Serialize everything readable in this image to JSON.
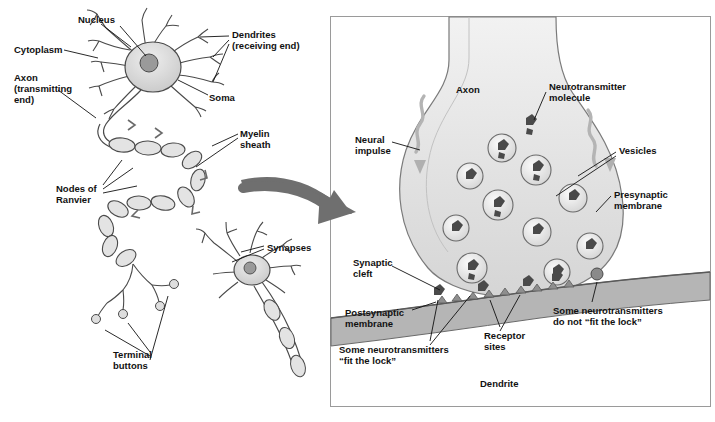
{
  "figure": {
    "panels": [
      {
        "id": "left",
        "name": "neuron-overview"
      },
      {
        "id": "right",
        "name": "synapse-detail"
      }
    ]
  },
  "colors": {
    "outline": "#4a4a4a",
    "cell_fill": "#d8d8d8",
    "cell_fill_light": "#ececec",
    "nucleus_fill": "#9a9a9a",
    "axon_fill": "#e3e3e3",
    "membrane_band": "#b8b8b8",
    "vesicle_fill": "#e8e8e8",
    "neurotransmitter": "#4a4a4a",
    "arrow_fill": "#5a5a5a",
    "panel_border": "#9a9a9a",
    "label_text": "#111111"
  },
  "left_panel": {
    "labels": [
      {
        "id": "nucleus",
        "text": "Nucleus",
        "x": 78,
        "y": 14,
        "align": "left"
      },
      {
        "id": "dendrites",
        "text": "Dendrites\n(receiving end)",
        "x": 232,
        "y": 29,
        "align": "left"
      },
      {
        "id": "cytoplasm",
        "text": "Cytoplasm",
        "x": 14,
        "y": 44,
        "align": "left"
      },
      {
        "id": "soma",
        "text": "Soma",
        "x": 209,
        "y": 92,
        "align": "left"
      },
      {
        "id": "axon",
        "text": "Axon\n(transmitting\nend)",
        "x": 14,
        "y": 72,
        "align": "left"
      },
      {
        "id": "myelin",
        "text": "Myelin\nsheath",
        "x": 240,
        "y": 128,
        "align": "left"
      },
      {
        "id": "nodes",
        "text": "Nodes of\nRanvier",
        "x": 56,
        "y": 183,
        "align": "left"
      },
      {
        "id": "synapses",
        "text": "Synapses",
        "x": 267,
        "y": 242,
        "align": "left"
      },
      {
        "id": "terminal",
        "text": "Terminal\nbuttons",
        "x": 113,
        "y": 349,
        "align": "left"
      }
    ]
  },
  "right_panel": {
    "labels": [
      {
        "id": "axon-r",
        "text": "Axon",
        "x": 456,
        "y": 84,
        "align": "left"
      },
      {
        "id": "neurotransmitter",
        "text": "Neurotransmitter\nmolecule",
        "x": 549,
        "y": 81,
        "align": "left"
      },
      {
        "id": "neural-impulse",
        "text": "Neural\nimpulse",
        "x": 355,
        "y": 134,
        "align": "left"
      },
      {
        "id": "vesicles",
        "text": "Vesicles",
        "x": 619,
        "y": 145,
        "align": "left"
      },
      {
        "id": "presynaptic",
        "text": "Presynaptic\nmembrane",
        "x": 614,
        "y": 189,
        "align": "left"
      },
      {
        "id": "synaptic-cleft",
        "text": "Synaptic\ncleft",
        "x": 353,
        "y": 257,
        "align": "left"
      },
      {
        "id": "postsynaptic",
        "text": "Postsynaptic\nmembrane",
        "x": 345,
        "y": 307,
        "align": "left"
      },
      {
        "id": "receptor-sites",
        "text": "Receptor\nsites",
        "x": 484,
        "y": 330,
        "align": "left"
      },
      {
        "id": "do-not-fit",
        "text": "Some neurotransmitters\ndo not “fit the lock”",
        "x": 553,
        "y": 305,
        "align": "left"
      },
      {
        "id": "fit-the-lock",
        "text": "Some neurotransmitters\n“fit the lock”",
        "x": 339,
        "y": 344,
        "align": "left"
      },
      {
        "id": "dendrite-r",
        "text": "Dendrite",
        "x": 480,
        "y": 378,
        "align": "left"
      }
    ]
  }
}
